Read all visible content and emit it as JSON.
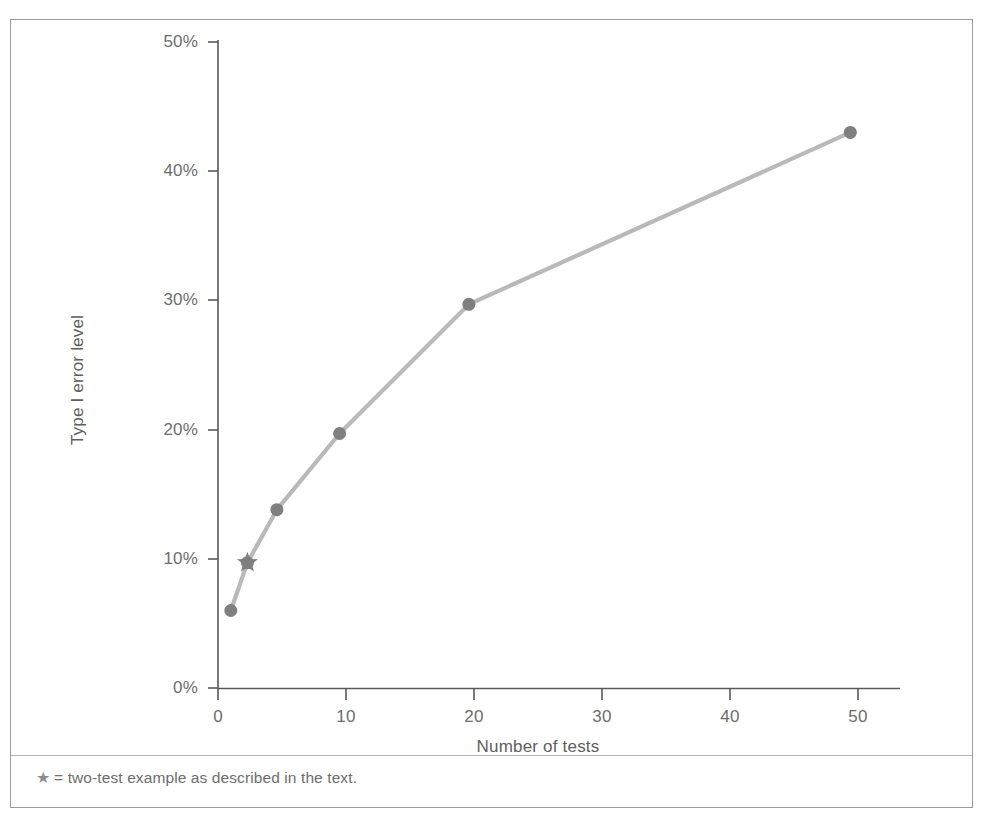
{
  "figure": {
    "footnote_marker": "★",
    "footnote_text": "= two-test example as described in the text.",
    "frame_color": "#9a9a9a",
    "axis_color": "#595959",
    "line_color": "#b9b9b9",
    "marker_color": "#7f7f7f",
    "text_color": "#6d6d6d"
  },
  "chart_data": {
    "type": "line",
    "title": "",
    "subtitle": "",
    "xlabel": "Number of tests",
    "ylabel": "Type I error level",
    "xlim": [
      0,
      53
    ],
    "ylim": [
      0,
      50
    ],
    "xticks": [
      0,
      10,
      20,
      30,
      40,
      50
    ],
    "xtick_labels": [
      "0",
      "10",
      "20",
      "30",
      "40",
      "50"
    ],
    "yticks": [
      0,
      10,
      20,
      30,
      40,
      50
    ],
    "ytick_labels": [
      "0%",
      "10%",
      "20%",
      "30%",
      "40%",
      "50%"
    ],
    "grid": false,
    "legend": null,
    "series": [
      {
        "name": "Type I error level",
        "marker": "circle",
        "x": [
          1,
          2.3,
          4.6,
          9.5,
          19.6,
          49.4
        ],
        "y": [
          6.0,
          9.7,
          13.8,
          19.7,
          29.7,
          43.0
        ]
      }
    ],
    "annotations": [
      {
        "name": "two-test-example",
        "marker": "star",
        "x": 2.3,
        "y": 9.7,
        "label": "two-test example as described in the text."
      }
    ]
  }
}
